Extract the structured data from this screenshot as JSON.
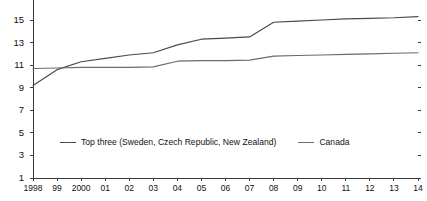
{
  "chart_data": {
    "type": "line",
    "title": "",
    "subtitle": "",
    "xlabel": "",
    "ylabel": "",
    "grid": false,
    "legend_position": "bottom-center",
    "xlim": [
      1998,
      2014
    ],
    "ylim": [
      1,
      17
    ],
    "yticks": [
      1,
      3,
      5,
      7,
      9,
      11,
      13,
      15,
      17
    ],
    "ytick_labels": [
      "1",
      "3",
      "5",
      "7",
      "9",
      "11",
      "13",
      "15",
      "17"
    ],
    "x": [
      1998,
      1999,
      2000,
      2001,
      2002,
      2003,
      2004,
      2005,
      2006,
      2007,
      2008,
      2009,
      2010,
      2011,
      2012,
      2013,
      2014
    ],
    "xtick_labels": [
      "1998",
      "99",
      "2000",
      "01",
      "02",
      "03",
      "04",
      "05",
      "06",
      "07",
      "08",
      "09",
      "10",
      "11",
      "12",
      "13",
      "14"
    ],
    "series": [
      {
        "name": "Top three (Sweden, Czech Republic, New Zealand)",
        "color": "#4a4a4a",
        "values": [
          9.2,
          10.6,
          11.3,
          11.6,
          11.9,
          12.1,
          12.8,
          13.3,
          13.4,
          13.5,
          14.8,
          14.9,
          15.0,
          15.1,
          15.15,
          15.2,
          15.3
        ]
      },
      {
        "name": "Canada",
        "color": "#6b6b6b",
        "values": [
          10.7,
          10.75,
          10.8,
          10.8,
          10.8,
          10.85,
          11.35,
          11.4,
          11.4,
          11.45,
          11.8,
          11.85,
          11.9,
          11.95,
          12.0,
          12.05,
          12.1
        ]
      }
    ]
  },
  "legend": {
    "entries": [
      {
        "label": "Top three (Sweden, Czech Republic, New Zealand)"
      },
      {
        "label": "Canada"
      }
    ]
  },
  "colors": {
    "top_three": "#4a4a4a",
    "canada": "#6b6b6b",
    "axis": "#3a3a3a",
    "text": "#111111",
    "background": "#ffffff"
  }
}
